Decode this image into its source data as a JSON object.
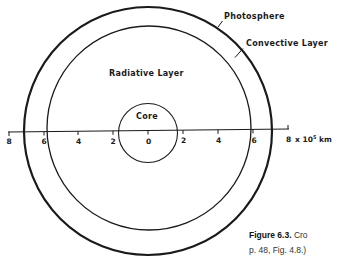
{
  "diagram": {
    "labels": {
      "photosphere": "Photosphere",
      "convective": "Convective Layer",
      "radiative": "Radiative Layer",
      "core": "Core"
    },
    "axis": {
      "ticks": [
        "8",
        "6",
        "4",
        "2",
        "0",
        "2",
        "4",
        "6",
        "8"
      ],
      "unit_prefix": "x 10",
      "unit_exp": "5",
      "unit_suffix": " km"
    },
    "colors": {
      "ink": "#1a1a1a",
      "background": "#ffffff"
    }
  },
  "caption": {
    "figure_label": "Figure 6.3.",
    "line1_text": " Cro",
    "line2_text": "p. 48, Fig. 4.8.)"
  }
}
